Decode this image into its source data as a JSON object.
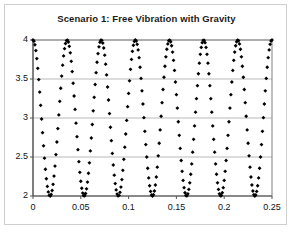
{
  "chart_data": {
    "type": "scatter",
    "title": "Scenario 1: Free Vibration with Gravity",
    "xlabel": "",
    "ylabel": "",
    "xlim": [
      0,
      0.25
    ],
    "ylim": [
      2,
      4
    ],
    "xticks": [
      "0",
      "0.05",
      "0.1",
      "0.15",
      "0.2",
      "0.25"
    ],
    "xtick_values": [
      0,
      0.05,
      0.1,
      0.15,
      0.2,
      0.25
    ],
    "yticks": [
      "2",
      "2.5",
      "3",
      "3.5",
      "4"
    ],
    "ytick_values": [
      2,
      2.5,
      3,
      3.5,
      4
    ],
    "grid": "horizontal",
    "legend": "none",
    "marker": "filled-diamond",
    "marker_color": "#000000",
    "gridline_color": "#b9b9b9",
    "axis_color": "#7f7f7f",
    "series": [
      {
        "name": "Displacement",
        "description": "Undamped free vibration: cosine oscillating between 2 and 4 about a mean of 3, amplitude 1, starting at maximum 4 at t = 0",
        "mean": 3,
        "amplitude": 1,
        "period": 0.0357,
        "frequency_hz": 28,
        "phase": "cosine (starts at peak)",
        "n_points": 251,
        "peaks_t": [
          0,
          0.0357,
          0.0714,
          0.1071,
          0.1429,
          0.1786,
          0.2143
        ],
        "peaks_y": [
          4,
          4,
          4,
          4,
          4,
          4,
          4
        ],
        "troughs_t": [
          0.0179,
          0.0536,
          0.0893,
          0.125,
          0.1607,
          0.1964,
          0.2321
        ],
        "troughs_y": [
          2,
          2,
          2,
          2,
          2,
          2,
          2
        ]
      }
    ]
  }
}
